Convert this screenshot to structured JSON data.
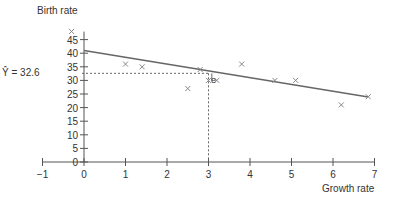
{
  "chart_data": {
    "type": "scatter",
    "title": "",
    "xlabel": "Growth rate",
    "ylabel": "Birth rate",
    "xlim": [
      -1,
      7
    ],
    "ylim": [
      0,
      45
    ],
    "x_ticks": [
      -1,
      0,
      1,
      2,
      3,
      4,
      5,
      6,
      7
    ],
    "y_ticks": [
      0,
      5,
      10,
      15,
      20,
      25,
      30,
      35,
      40,
      45
    ],
    "grid": false,
    "legend": null,
    "series": [
      {
        "name": "observations",
        "marker": "x",
        "points": [
          {
            "x": -0.3,
            "y": 48
          },
          {
            "x": 1.0,
            "y": 36
          },
          {
            "x": 1.4,
            "y": 35
          },
          {
            "x": 2.5,
            "y": 27
          },
          {
            "x": 2.8,
            "y": 34
          },
          {
            "x": 3.0,
            "y": 30
          },
          {
            "x": 3.2,
            "y": 30
          },
          {
            "x": 3.8,
            "y": 36
          },
          {
            "x": 4.6,
            "y": 30
          },
          {
            "x": 5.1,
            "y": 30
          },
          {
            "x": 6.2,
            "y": 21
          },
          {
            "x": 6.85,
            "y": 24
          }
        ]
      }
    ],
    "regression_line": {
      "x0": 0,
      "y0": 41.0,
      "x1": 6.85,
      "y1": 23.9
    },
    "annotations": [
      {
        "text": "Ŷ = 32.6",
        "type": "predicted-value",
        "x": 3,
        "y": 32.6
      },
      {
        "text": "e",
        "type": "residual-label",
        "x": 3.1,
        "y": 31.5
      }
    ]
  },
  "labels": {
    "ylabel": "Birth rate",
    "xlabel": "Growth rate",
    "yhat": "Ŷ = 32.6",
    "residual": "e"
  }
}
